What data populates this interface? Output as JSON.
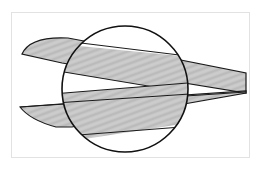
{
  "illustration": {
    "subject": "scissor blades cutting with magnified circular detail",
    "colors": {
      "background": "#ffffff",
      "frame": "#e2e2e2",
      "blade_fill": "#c4c4c4",
      "blade_shade": "#a9a9a9",
      "outline": "#1a1a1a"
    }
  }
}
